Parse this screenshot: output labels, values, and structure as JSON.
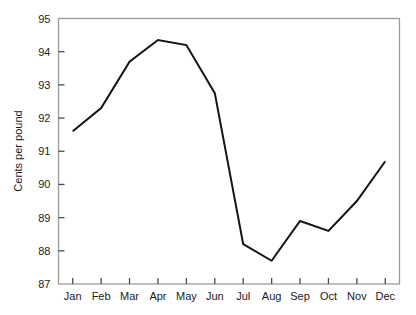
{
  "chart_data": {
    "type": "line",
    "title": "",
    "subtitle": "",
    "xlabel": "",
    "ylabel": "Cents per pound",
    "categories": [
      "Jan",
      "Feb",
      "Mar",
      "Apr",
      "May",
      "Jun",
      "Jul",
      "Aug",
      "Sep",
      "Oct",
      "Nov",
      "Dec"
    ],
    "values": [
      91.6,
      92.3,
      93.7,
      94.35,
      94.2,
      92.75,
      88.2,
      87.7,
      88.9,
      88.6,
      89.5,
      90.7
    ],
    "ylim": [
      87,
      95
    ],
    "yticks": [
      87,
      88,
      89,
      90,
      91,
      92,
      93,
      94,
      95
    ],
    "ytick_labels": [
      "87",
      "88",
      "89",
      "90",
      "91",
      "92",
      "93",
      "94",
      "95"
    ],
    "grid": false,
    "legend": false,
    "legend_position": "none",
    "line_color": "#141414",
    "line_width": 2,
    "markers": false,
    "frame_color": "#9a9a9a",
    "background": "#ffffff"
  },
  "axes": {
    "y_axis_title": "Cents per pound",
    "x_axis_title": ""
  }
}
